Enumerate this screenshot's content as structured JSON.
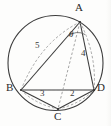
{
  "figure": {
    "type": "geometry-diagram",
    "background_color": "#fdfdfc",
    "stroke_color": "#3c3c3c",
    "dashed_color": "#8f8f8f",
    "circle": {
      "center_x": 55.5,
      "center_y": 63,
      "radius": 47.5
    },
    "vertices": [
      {
        "id": "A",
        "label": "A",
        "x": 80,
        "y": 22,
        "label_x": 76,
        "label_y": 3
      },
      {
        "id": "B",
        "label": "B",
        "x": 21,
        "y": 90,
        "label_x": 7,
        "label_y": 84
      },
      {
        "id": "C",
        "label": "C",
        "x": 58,
        "y": 109,
        "label_x": 55,
        "label_y": 112
      },
      {
        "id": "D",
        "label": "D",
        "x": 94,
        "y": 90,
        "label_x": 97,
        "label_y": 84
      }
    ],
    "solid_edges": [
      {
        "id": "AB",
        "from": "A",
        "to": "B"
      },
      {
        "id": "AD",
        "from": "A",
        "to": "D"
      },
      {
        "id": "BD",
        "from": "B",
        "to": "D"
      },
      {
        "id": "BC",
        "from": "B",
        "to": "C"
      },
      {
        "id": "CD",
        "from": "C",
        "to": "D"
      }
    ],
    "dashed_edges": [
      {
        "id": "AC",
        "from": "A",
        "to": "C"
      },
      {
        "id": "BD-dashed",
        "from": "B",
        "to": "D"
      }
    ],
    "side_labels": [
      {
        "id": "len-AB",
        "edge": "AB",
        "text": "5",
        "x": 38,
        "y": 45
      },
      {
        "id": "len-AD",
        "edge": "AD",
        "text": "4",
        "x": 82,
        "y": 53
      },
      {
        "id": "len-BC",
        "edge": "BC",
        "text": "3",
        "x": 41,
        "y": 93
      },
      {
        "id": "len-CD",
        "edge": "CD",
        "text": "2",
        "x": 71,
        "y": 93
      }
    ],
    "angle": {
      "id": "theta-at-A",
      "text": "θ",
      "vertex": "A",
      "x": 70,
      "y": 33,
      "arc_radius": 13
    }
  }
}
